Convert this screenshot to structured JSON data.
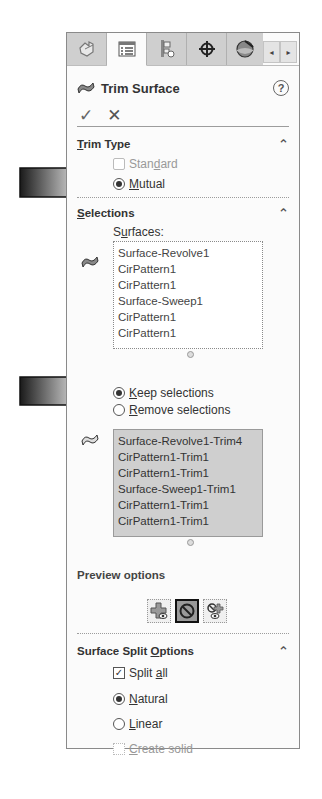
{
  "tabs": [
    {
      "name": "feature-manager",
      "icon": "feature-tree-icon",
      "active": false
    },
    {
      "name": "property-manager",
      "icon": "property-list-icon",
      "active": true
    },
    {
      "name": "configuration-manager",
      "icon": "configuration-icon",
      "active": false
    },
    {
      "name": "dimxpert-manager",
      "icon": "crosshair-target-icon",
      "active": false
    },
    {
      "name": "display-manager",
      "icon": "appearance-sphere-icon",
      "active": false
    }
  ],
  "scroll": {
    "left": "◂",
    "right": "▸"
  },
  "header": {
    "title": "Trim Surface",
    "help": "?"
  },
  "actions": {
    "ok": "✓",
    "cancel": "✕"
  },
  "trim_type": {
    "title_pre": "",
    "title_u": "T",
    "title_post": "rim Type",
    "options": [
      {
        "label_pre": "Stan",
        "label_u": "d",
        "label_post": "ard",
        "selected": false,
        "enabled": false
      },
      {
        "label_pre": "",
        "label_u": "M",
        "label_post": "utual",
        "selected": true,
        "enabled": true
      }
    ]
  },
  "selections": {
    "title_pre": "",
    "title_u": "S",
    "title_post": "elections",
    "surfaces_label_pre": "S",
    "surfaces_label_u": "u",
    "surfaces_label_post": "rfaces:",
    "surfaces": [
      "Surface-Revolve1",
      "CirPattern1",
      "CirPattern1",
      "Surface-Sweep1",
      "CirPattern1",
      "CirPattern1"
    ],
    "mode_options": [
      {
        "label_pre": "",
        "label_u": "K",
        "label_post": "eep selections",
        "selected": true
      },
      {
        "label_pre": "",
        "label_u": "R",
        "label_post": "emove selections",
        "selected": false
      }
    ],
    "pieces": [
      "Surface-Revolve1-Trim4",
      "CirPattern1-Trim1",
      "CirPattern1-Trim1",
      "Surface-Sweep1-Trim1",
      "CirPattern1-Trim1",
      "CirPattern1-Trim1"
    ]
  },
  "preview": {
    "label": "Preview options",
    "buttons": [
      {
        "name": "show-included-preview",
        "active": false
      },
      {
        "name": "no-preview",
        "active": true
      },
      {
        "name": "show-excluded-preview",
        "active": false
      }
    ]
  },
  "split": {
    "title_pre": "Surface Split ",
    "title_u": "O",
    "title_post": "ptions",
    "split_all": {
      "label_pre": "Split ",
      "label_u": "a",
      "label_post": "ll",
      "checked": true
    },
    "natural": {
      "label_pre": "",
      "label_u": "N",
      "label_post": "atural",
      "selected": true
    },
    "linear": {
      "label_pre": "",
      "label_u": "L",
      "label_post": "inear",
      "selected": false
    },
    "create_solid": {
      "label_pre": "",
      "label_u": "C",
      "label_post": "reate solid",
      "checked": false,
      "enabled": false
    }
  },
  "callout_arrows": [
    {
      "points_to": "Mutual"
    },
    {
      "points_to": "Keep selections"
    }
  ],
  "colors": {
    "panel_bg": "#fbfbfb",
    "tab_bg": "#cfcfcf",
    "list_filled_bg": "#cfcfcf",
    "border": "#8a8a8a"
  }
}
